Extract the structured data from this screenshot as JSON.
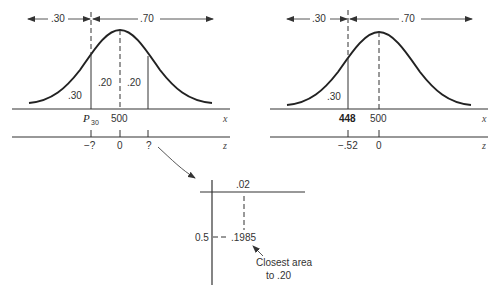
{
  "left_panel": {
    "top_left_area": ".30",
    "top_right_area": ".70",
    "area_left_tail": ".30",
    "area_center_left": ".20",
    "area_center_right": ".20",
    "x_label_p": "P",
    "x_label_p_sub": "30",
    "x_label_mean": "500",
    "x_axis_name": "x",
    "z_label_neg": "−?",
    "z_label_zero": "0",
    "z_label_pos": "?",
    "z_axis_name": "z"
  },
  "right_panel": {
    "top_left_area": ".30",
    "top_right_area": ".70",
    "area_left_tail": ".30",
    "x_label_score": "448",
    "x_label_mean": "500",
    "x_axis_name": "x",
    "z_label_neg": "−.52",
    "z_label_zero": "0",
    "z_axis_name": "z"
  },
  "table_lookup": {
    "column_header": ".02",
    "row_header": "0.5",
    "cell_value": ".1985",
    "note_line1": "Closest area",
    "note_line2": "to .20"
  },
  "colors": {
    "ink": "#222222",
    "background": "#ffffff"
  }
}
